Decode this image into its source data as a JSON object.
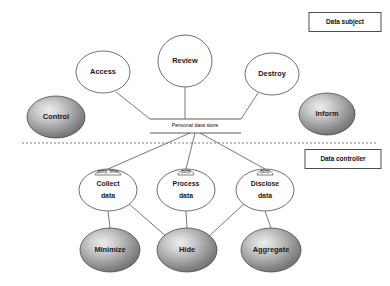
{
  "diagram": {
    "colors": {
      "line": "#555555",
      "node_stroke": "#4a4a4a",
      "shaded_light": "#e8e8e8",
      "shaded_mid": "#a8a8a8",
      "shaded_dark": "#6b6b6b",
      "text": "#111111",
      "divider": "#6f6f6f"
    },
    "legend": [
      {
        "id": "legend-data-subject",
        "label": "Data subject",
        "x": 345,
        "y": 22,
        "w": 72,
        "h": 19
      },
      {
        "id": "legend-data-controller",
        "label": "Data controller",
        "x": 343,
        "y": 159,
        "w": 76,
        "h": 19
      }
    ],
    "divider": {
      "label": "",
      "x1": 22,
      "x2": 378,
      "y": 143
    },
    "store": {
      "label": "Personal data store",
      "cx": 195,
      "cy": 126,
      "top_rule": {
        "x1": 150,
        "x2": 241,
        "y": 119
      },
      "bottom_rule": {
        "x1": 150,
        "x2": 241,
        "y": 133
      }
    },
    "nodes": [
      {
        "id": "control",
        "label": "Control",
        "style": "shaded",
        "cx": 56,
        "cy": 117,
        "rx": 29,
        "ry": 21
      },
      {
        "id": "access",
        "label": "Access",
        "style": "open",
        "cx": 103,
        "cy": 72,
        "rx": 27,
        "ry": 21
      },
      {
        "id": "review",
        "label": "Review",
        "style": "open",
        "cx": 185,
        "cy": 61,
        "rx": 27,
        "ry": 26
      },
      {
        "id": "destroy",
        "label": "Destroy",
        "style": "open",
        "cx": 272,
        "cy": 74,
        "rx": 27,
        "ry": 21
      },
      {
        "id": "inform",
        "label": "Inform",
        "style": "shaded",
        "cx": 327,
        "cy": 114,
        "rx": 28,
        "ry": 21
      },
      {
        "id": "collect",
        "label": "Collect data",
        "lines": [
          "Collect",
          "data"
        ],
        "style": "open",
        "cx": 108,
        "cy": 190,
        "rx": 29,
        "ry": 21
      },
      {
        "id": "process",
        "label": "Process data",
        "lines": [
          "Process",
          "data"
        ],
        "style": "open",
        "cx": 186,
        "cy": 190,
        "rx": 29,
        "ry": 21
      },
      {
        "id": "disclose",
        "label": "Disclose data",
        "lines": [
          "Disclose",
          "data"
        ],
        "style": "open",
        "cx": 265,
        "cy": 190,
        "rx": 29,
        "ry": 21
      },
      {
        "id": "minimize",
        "label": "Minimize",
        "style": "shaded",
        "cx": 110,
        "cy": 250,
        "rx": 30,
        "ry": 22
      },
      {
        "id": "hide",
        "label": "Hide",
        "style": "shaded",
        "cx": 187,
        "cy": 250,
        "rx": 30,
        "ry": 22
      },
      {
        "id": "aggregate",
        "label": "Aggregate",
        "style": "shaded",
        "cx": 271,
        "cy": 250,
        "rx": 30,
        "ry": 22
      }
    ],
    "edge_labels": [
      {
        "id": "edge-label-collect",
        "label": "purp, time",
        "cx": 108,
        "cy": 171
      },
      {
        "id": "edge-label-process",
        "label": "purp",
        "cx": 186,
        "cy": 171
      },
      {
        "id": "edge-label-disclose",
        "label": "purp",
        "cx": 265,
        "cy": 171
      }
    ],
    "edges": [
      {
        "id": "edge-access-store",
        "points": "116,92 150,119"
      },
      {
        "id": "edge-review-store",
        "points": "185,87 185,119"
      },
      {
        "id": "edge-destroy-store",
        "points": "258,93 241,119"
      },
      {
        "id": "edge-store-collect",
        "points": "190,133 108,169"
      },
      {
        "id": "edge-store-process",
        "points": "195,133 186,169"
      },
      {
        "id": "edge-store-disclose",
        "points": "200,133 265,169"
      },
      {
        "id": "edge-collect-minimize",
        "points": "108,211 110,228"
      },
      {
        "id": "edge-collect-hide",
        "points": "128,203 168,238"
      },
      {
        "id": "edge-process-hide",
        "points": "186,211 187,228"
      },
      {
        "id": "edge-disclose-hide",
        "points": "245,203 207,238"
      },
      {
        "id": "edge-disclose-aggregate",
        "points": "265,211 271,228"
      }
    ]
  }
}
